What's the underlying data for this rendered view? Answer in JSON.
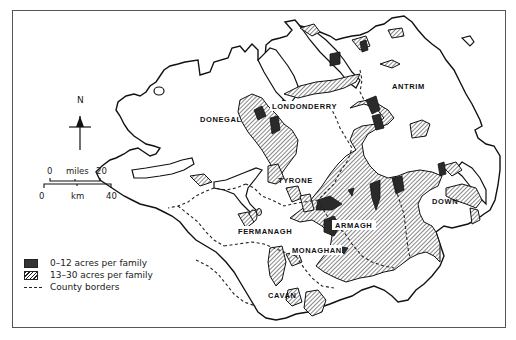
{
  "map": {
    "region": "Ulster",
    "counties": [
      {
        "name": "DONEGAL",
        "x": 200,
        "y": 120
      },
      {
        "name": "LONDONDERRY",
        "x": 302,
        "y": 107
      },
      {
        "name": "ANTRIM",
        "x": 395,
        "y": 87
      },
      {
        "name": "TYRONE",
        "x": 280,
        "y": 181
      },
      {
        "name": "FERMANAGH",
        "x": 241,
        "y": 232
      },
      {
        "name": "ARMAGH",
        "x": 355,
        "y": 226
      },
      {
        "name": "DOWN",
        "x": 433,
        "y": 203
      },
      {
        "name": "MONAGHAN",
        "x": 308,
        "y": 251
      },
      {
        "name": "CAVAN",
        "x": 270,
        "y": 296
      }
    ]
  },
  "compass": {
    "label": "N"
  },
  "scale": {
    "miles_start": "0",
    "miles_label": "miles",
    "miles_end": "20",
    "km_start": "0",
    "km_label": "km",
    "km_end": "40"
  },
  "legend": {
    "items": [
      {
        "label": "0–12 acres per family",
        "style": "dark"
      },
      {
        "label": "13–30 acres per family",
        "style": "hatch"
      },
      {
        "label": "County borders",
        "style": "dash"
      }
    ]
  },
  "colors": {
    "ink": "#222222",
    "dark_fill": "#333333",
    "background": "#ffffff"
  }
}
